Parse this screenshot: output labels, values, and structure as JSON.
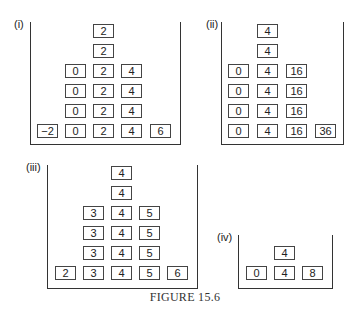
{
  "caption": "FIGURE 15.6",
  "panels": [
    {
      "label": "(i)",
      "columns": [
        {
          "values": [
            "−2"
          ]
        },
        {
          "values": [
            "0",
            "0",
            "0",
            "0"
          ]
        },
        {
          "values": [
            "2",
            "2",
            "2",
            "2",
            "2",
            "2"
          ]
        },
        {
          "values": [
            "4",
            "4",
            "4",
            "4"
          ]
        },
        {
          "values": [
            "6"
          ]
        }
      ]
    },
    {
      "label": "(ii)",
      "columns": [
        {
          "values": [
            "0",
            "0",
            "0",
            "0"
          ]
        },
        {
          "values": [
            "4",
            "4",
            "4",
            "4",
            "4",
            "4"
          ]
        },
        {
          "values": [
            "16",
            "16",
            "16",
            "16"
          ]
        },
        {
          "values": [
            "36"
          ]
        }
      ]
    },
    {
      "label": "(iii)",
      "columns": [
        {
          "values": [
            "2"
          ]
        },
        {
          "values": [
            "3",
            "3",
            "3",
            "3"
          ]
        },
        {
          "values": [
            "4",
            "4",
            "4",
            "4",
            "4",
            "4"
          ]
        },
        {
          "values": [
            "5",
            "5",
            "5",
            "5"
          ]
        },
        {
          "values": [
            "6"
          ]
        }
      ]
    },
    {
      "label": "(iv)",
      "columns": [
        {
          "values": [
            "0"
          ]
        },
        {
          "values": [
            "4",
            "4"
          ]
        },
        {
          "values": [
            "8"
          ]
        }
      ]
    }
  ]
}
